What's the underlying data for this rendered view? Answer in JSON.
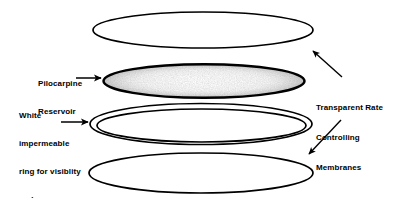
{
  "figure": {
    "background_color": "#ffffff",
    "ink_color": "#000000",
    "stipple_color": "#b9b9b9"
  },
  "labels": {
    "reservoir": {
      "name": "Pilocarpine Reservoir",
      "lines": [
        "Pilocarpine",
        "Reservoir"
      ]
    },
    "ring": {
      "name": "White impermeable ring for visibility and handling",
      "lines": [
        "White",
        "impermeable",
        "ring for visiblity",
        "and",
        "handling"
      ]
    },
    "membranes": {
      "name": "Transparent Rate Controlling Membranes",
      "lines": [
        "Transparent Rate",
        "Controlling",
        "Membranes"
      ]
    }
  },
  "parts": [
    {
      "id": "top-membrane",
      "label": "Transparent rate controlling membrane (top)",
      "shape": "ellipse",
      "cx": 203,
      "cy": 30,
      "rx": 110,
      "ry": 18,
      "fill": "none",
      "stroke": "#000000",
      "stroke_width": 1.6
    },
    {
      "id": "pilocarpine-reservoir",
      "label": "Pilocarpine reservoir",
      "shape": "ellipse",
      "cx": 204,
      "cy": 81,
      "rx": 101,
      "ry": 17,
      "fill": "stipple",
      "stroke": "#000000",
      "stroke_width": 2.4
    },
    {
      "id": "white-ring-outer",
      "label": "White impermeable ring (outer edge)",
      "shape": "ellipse",
      "cx": 201,
      "cy": 124,
      "rx": 111,
      "ry": 21,
      "fill": "none",
      "stroke": "#000000",
      "stroke_width": 1.6
    },
    {
      "id": "white-ring-inner",
      "label": "White impermeable ring (inner edge)",
      "shape": "ellipse",
      "cx": 201,
      "cy": 125,
      "rx": 105,
      "ry": 17,
      "fill": "none",
      "stroke": "#000000",
      "stroke_width": 1.6
    },
    {
      "id": "bottom-membrane",
      "label": "Transparent rate controlling membrane (bottom)",
      "shape": "ellipse",
      "cx": 201,
      "cy": 173,
      "rx": 112,
      "ry": 20,
      "fill": "none",
      "stroke": "#000000",
      "stroke_width": 1.6
    }
  ],
  "arrows": [
    {
      "id": "arrow-reservoir",
      "label": "Arrow from Pilocarpine Reservoir label to reservoir ellipse",
      "x1": 76,
      "y1": 78,
      "x2": 104,
      "y2": 78
    },
    {
      "id": "arrow-ring",
      "label": "Arrow from white impermeable ring label to ring ellipse",
      "x1": 61,
      "y1": 122,
      "x2": 90,
      "y2": 122
    },
    {
      "id": "arrow-membrane-top",
      "label": "Arrow from Transparent Rate Controlling Membranes label to top membrane",
      "x1": 340,
      "y1": 78,
      "x2": 311,
      "y2": 52
    },
    {
      "id": "arrow-membrane-bottom",
      "label": "Arrow from Transparent Rate Controlling Membranes label to bottom membrane",
      "x1": 340,
      "y1": 122,
      "x2": 308,
      "y2": 155
    }
  ]
}
